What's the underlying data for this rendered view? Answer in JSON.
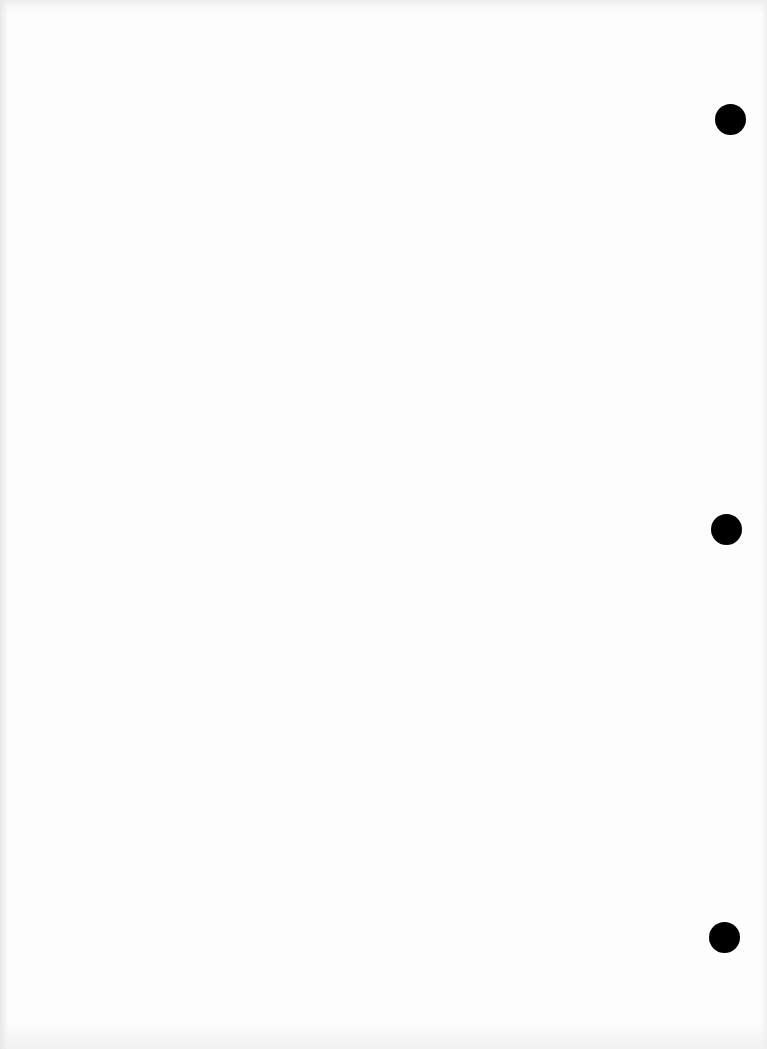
{
  "document": {
    "type": "blank-scanned-page",
    "text": "",
    "background_color": "#fdfdfd",
    "punch_holes": [
      {
        "cx": 731,
        "cy": 120
      },
      {
        "cx": 727,
        "cy": 530
      },
      {
        "cx": 725,
        "cy": 938
      }
    ],
    "punch_hole_color": "#000000"
  }
}
